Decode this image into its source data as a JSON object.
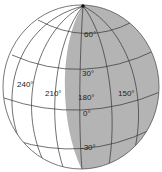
{
  "diagram": {
    "type": "globe-graticule",
    "colors": {
      "background": "#ffffff",
      "shaded": "#b4b4b4",
      "line": "#333333",
      "outline": "#555555"
    },
    "latitude_labels": [
      {
        "text": "60°",
        "x": 84,
        "y": 37
      },
      {
        "text": "30°",
        "x": 82,
        "y": 76
      },
      {
        "text": "0°",
        "x": 83,
        "y": 116
      },
      {
        "text": "-30°",
        "x": 81,
        "y": 150
      }
    ],
    "longitude_labels": [
      {
        "text": "240°",
        "x": 17,
        "y": 87
      },
      {
        "text": "210°",
        "x": 45,
        "y": 96
      },
      {
        "text": "180°",
        "x": 78,
        "y": 100
      },
      {
        "text": "150°",
        "x": 118,
        "y": 96
      }
    ]
  }
}
